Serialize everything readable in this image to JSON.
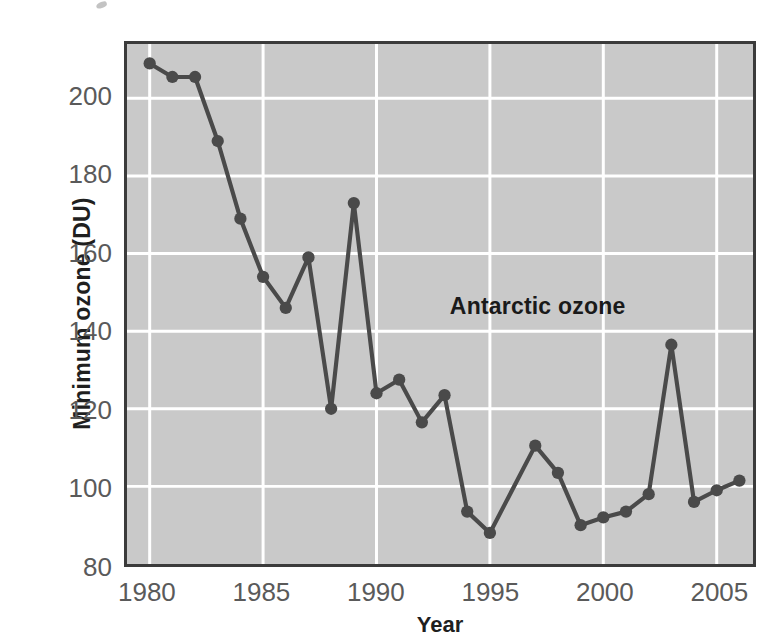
{
  "chart_data": {
    "type": "line",
    "title": "",
    "xlabel": "Year",
    "ylabel": "Minimum ozone (DU)",
    "xlim": [
      1979,
      2006.6
    ],
    "ylim": [
      80,
      214
    ],
    "grid": true,
    "legend": "none",
    "xticks": [
      1980,
      1985,
      1990,
      1995,
      2000,
      2005
    ],
    "xtick_labels": [
      "1980",
      "1985",
      "1990",
      "1995",
      "2000",
      "2005"
    ],
    "yticks": [
      80,
      100,
      120,
      140,
      160,
      180,
      200
    ],
    "ytick_labels": [
      "80",
      "100",
      "120",
      "140",
      "160",
      "180",
      "200"
    ],
    "annotations": [
      {
        "text": "Antarctic ozone",
        "x": 1993.1,
        "y": 147
      }
    ],
    "series": [
      {
        "name": "Antarctic ozone",
        "color": "#4a4a4a",
        "marker": "circle",
        "x": [
          1980,
          1981,
          1982,
          1983,
          1984,
          1985,
          1986,
          1987,
          1988,
          1989,
          1990,
          1991,
          1992,
          1993,
          1994,
          1995,
          1997,
          1998,
          1999,
          2000,
          2001,
          2002,
          2003,
          2004,
          2005,
          2006
        ],
        "values": [
          209,
          205.5,
          205.5,
          189,
          169,
          154,
          146,
          159,
          120,
          173,
          124,
          127.5,
          116.5,
          123.5,
          93.5,
          88,
          110.5,
          103.5,
          90,
          92,
          93.5,
          98,
          136.5,
          96,
          99,
          101.5
        ]
      }
    ]
  },
  "axes": {
    "x_title": "Year",
    "y_title": "Minimum ozone (DU)"
  }
}
